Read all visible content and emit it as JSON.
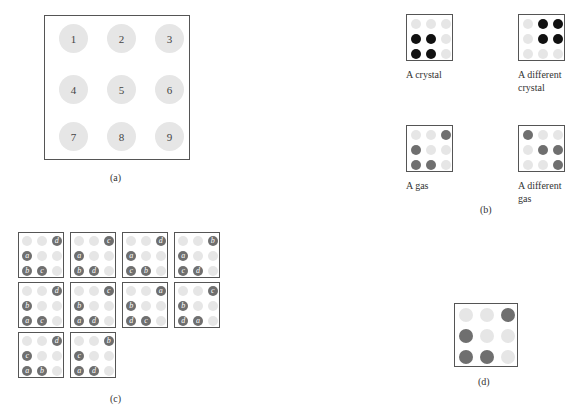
{
  "figure": {
    "panel_a": {
      "caption": "(a)",
      "positions": [
        "1",
        "2",
        "3",
        "4",
        "5",
        "6",
        "7",
        "8",
        "9"
      ]
    },
    "panel_b": {
      "caption": "(b)",
      "states": [
        {
          "label": "A crystal",
          "occupied": [
            4,
            5,
            7,
            8
          ],
          "style": "black"
        },
        {
          "label": "A different crystal",
          "label_lines": [
            "A different",
            "crystal"
          ],
          "occupied": [
            2,
            3,
            5,
            6
          ],
          "style": "black"
        },
        {
          "label": "A gas",
          "occupied": [
            3,
            4,
            7,
            8
          ],
          "style": "gray"
        },
        {
          "label": "A different gas",
          "label_lines": [
            "A different",
            "gas"
          ],
          "occupied": [
            1,
            5,
            6,
            9
          ],
          "style": "gray"
        }
      ]
    },
    "panel_c": {
      "caption": "(c)",
      "occupied_positions": [
        3,
        4,
        7,
        8
      ],
      "arrangements": [
        {
          "p3": "d",
          "p4": "a",
          "p7": "b",
          "p8": "c"
        },
        {
          "p3": "c",
          "p4": "a",
          "p7": "b",
          "p8": "d"
        },
        {
          "p3": "d",
          "p4": "a",
          "p7": "c",
          "p8": "b"
        },
        {
          "p3": "b",
          "p4": "a",
          "p7": "c",
          "p8": "d"
        },
        {
          "p3": "d",
          "p4": "b",
          "p7": "a",
          "p8": "c"
        },
        {
          "p3": "c",
          "p4": "b",
          "p7": "a",
          "p8": "d"
        },
        {
          "p3": "a",
          "p4": "b",
          "p7": "d",
          "p8": "c"
        },
        {
          "p3": "c",
          "p4": "b",
          "p7": "d",
          "p8": "a"
        },
        {
          "p3": "d",
          "p4": "c",
          "p7": "a",
          "p8": "b"
        },
        {
          "p3": "b",
          "p4": "c",
          "p7": "a",
          "p8": "d"
        }
      ]
    },
    "panel_d": {
      "caption": "(d)",
      "occupied": [
        3,
        4,
        7,
        8
      ]
    }
  },
  "colors": {
    "empty_site": "#e6e6e6",
    "crystal_molecule": "#111111",
    "gas_molecule": "#6f6f6f",
    "border": "#555555"
  }
}
